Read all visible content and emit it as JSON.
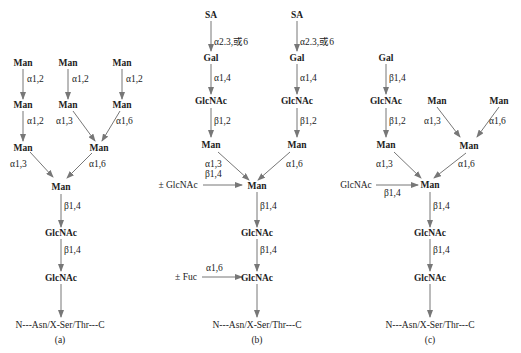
{
  "panels": {
    "a": {
      "label": "(a)",
      "nodes": {
        "man_l1": "Man",
        "man_m1": "Man",
        "man_r1": "Man",
        "man_l2": "Man",
        "man_m2": "Man",
        "man_r2": "Man",
        "man_l3": "Man",
        "man_c3": "Man",
        "man_core": "Man",
        "glcnac_1": "GlcNAc",
        "glcnac_2": "GlcNAc"
      },
      "bonds": {
        "l1_l2": "α1,2",
        "m1_m2": "α1,2",
        "r1_r2": "α1,2",
        "l2_l3": "α1,2",
        "m2_c3": "α1,3",
        "r2_c3": "α1,6",
        "l3_core": "α1,3",
        "c3_core": "α1,6",
        "core_g1": "β1,4",
        "g1_g2": "β1,4"
      },
      "peptide": "N---Asn/X-Ser/Thr---C"
    },
    "b": {
      "label": "(b)",
      "nodes": {
        "sa_l": "SA",
        "sa_r": "SA",
        "gal_l": "Gal",
        "gal_r": "Gal",
        "glcnac_l": "GlcNAc",
        "glcnac_r": "GlcNAc",
        "man_l": "Man",
        "man_r": "Man",
        "man_core": "Man",
        "bisect_glcnac": "± GlcNAc",
        "glcnac_1": "GlcNAc",
        "glcnac_2": "GlcNAc",
        "fuc": "± Fuc"
      },
      "bonds": {
        "sa_gal_l": "α2.3,或6",
        "sa_gal_r": "α2.3,或6",
        "gal_glcnac_l": "α1,4",
        "gal_glcnac_r": "α1,4",
        "glcnac_man_l": "β1,2",
        "glcnac_man_r": "β1,2",
        "man_l_core": "α1,3",
        "man_r_core": "α1,6",
        "bisect": "β1,4",
        "core_g1": "β1,4",
        "g1_g2": "β1,4",
        "fuc_g2": "α1,6"
      },
      "peptide": "N---Asn/X-Ser/Thr---C"
    },
    "c": {
      "label": "(c)",
      "nodes": {
        "gal": "Gal",
        "glcnac_l": "GlcNAc",
        "man_l": "Man",
        "man_m1": "Man",
        "man_r1": "Man",
        "man_c": "Man",
        "man_core": "Man",
        "bisect_glcnac": "GlcNAc",
        "glcnac_1": "GlcNAc",
        "glcnac_2": "GlcNAc"
      },
      "bonds": {
        "gal_glcnac": "β1,4",
        "glcnac_man": "β1,2",
        "m1_c": "α1,3",
        "r1_c": "α1,6",
        "man_l_core": "α1,3",
        "c_core": "α1,6",
        "bisect": "β1,4",
        "core_g1": "β1,4",
        "g1_g2": "β1,4"
      },
      "peptide": "N---Asn/X-Ser/Thr---C"
    }
  },
  "colors": {
    "arrow": "#777777",
    "text": "#222222"
  }
}
